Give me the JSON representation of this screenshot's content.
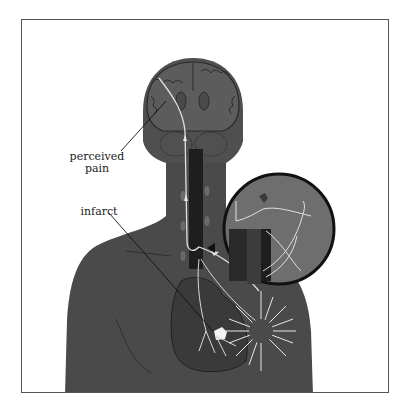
{
  "figure": {
    "labels": {
      "perceived_pain_line1": "perceived",
      "perceived_pain_line2": "pain",
      "infarct": "infarct"
    },
    "colors": {
      "background": "#ffffff",
      "frame": "#555555",
      "body": "#4a4a4a",
      "brain": "#5a5a5a",
      "spinal_cord": "#1e1e1e",
      "nerve_paths": "#d8d8d8",
      "inset_fill": "#6a6a6a",
      "inset_border": "#111111",
      "infarct_patch": "#f2f2f2",
      "heart": "#3a3a3a"
    }
  }
}
